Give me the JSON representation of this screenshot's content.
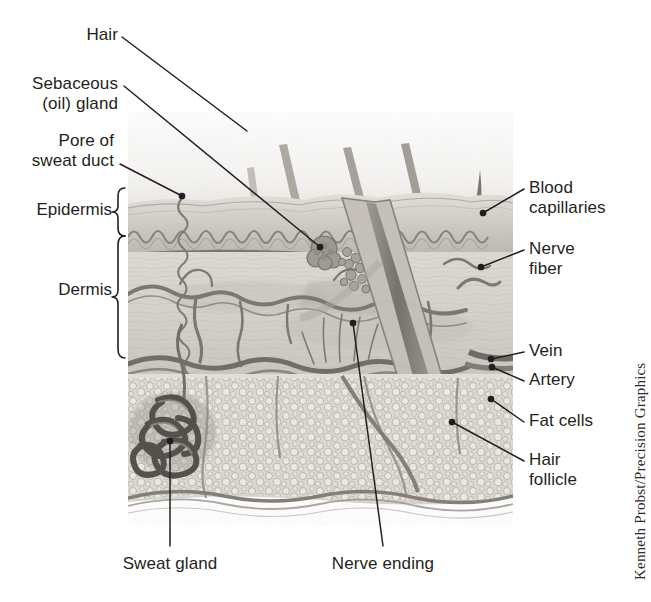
{
  "figure": {
    "credit": "Kenneth Probst/Precision Graphics",
    "style": "grayscale pencil illustration"
  },
  "colors": {
    "text": "#231f20",
    "leader_line": "#231f20",
    "credit_text": "#2b2b2b",
    "background": "#ffffff",
    "skin_light": "#e9e7e2",
    "skin_mid": "#cdc9c2",
    "skin_dark": "#8f8a84",
    "hair_dark": "#6e6a66",
    "fat_fill": "#ddd9d2"
  },
  "labels": {
    "hair": "Hair",
    "sebaceous_gland": "Sebaceous\n(oil) gland",
    "pore_of_sweat_duct": "Pore of\nsweat duct",
    "epidermis": "Epidermis",
    "dermis": "Dermis",
    "blood_capillaries": "Blood\ncapillaries",
    "nerve_fiber": "Nerve\nfiber",
    "vein": "Vein",
    "artery": "Artery",
    "fat_cells": "Fat cells",
    "hair_follicle": "Hair\nfollicle",
    "sweat_gland": "Sweat gland",
    "nerve_ending": "Nerve ending"
  },
  "annotations": [
    {
      "id": "hair",
      "label": "Hair",
      "side": "left",
      "label_x": 75,
      "label_y": 25,
      "line": [
        [
          122,
          37
        ],
        [
          247,
          131
        ]
      ],
      "dot": false
    },
    {
      "id": "sebaceous-gland",
      "label": "Sebaceous\n(oil) gland",
      "side": "left",
      "label_x": 20,
      "label_y": 74,
      "line": [
        [
          124,
          86
        ],
        [
          320,
          247
        ]
      ],
      "dot": true
    },
    {
      "id": "pore-of-sweat-duct",
      "label": "Pore of\nsweat duct",
      "side": "left",
      "label_x": 23,
      "label_y": 131,
      "line": [
        [
          120,
          164
        ],
        [
          182,
          196
        ]
      ],
      "dot": true
    },
    {
      "id": "blood-capillaries",
      "label": "Blood\ncapillaries",
      "side": "right",
      "label_x": 529,
      "label_y": 178,
      "line": [
        [
          524,
          189
        ],
        [
          483,
          213
        ]
      ],
      "dot": true
    },
    {
      "id": "nerve-fiber",
      "label": "Nerve\nfiber",
      "side": "right",
      "label_x": 529,
      "label_y": 239,
      "line": [
        [
          524,
          250
        ],
        [
          481,
          267
        ]
      ],
      "dot": true
    },
    {
      "id": "vein",
      "label": "Vein",
      "side": "right",
      "label_x": 529,
      "label_y": 341,
      "line": [
        [
          524,
          352
        ],
        [
          491,
          359
        ]
      ],
      "dot": true
    },
    {
      "id": "artery",
      "label": "Artery",
      "side": "right",
      "label_x": 529,
      "label_y": 370,
      "line": [
        [
          524,
          381
        ],
        [
          492,
          367
        ]
      ],
      "dot": true
    },
    {
      "id": "fat-cells",
      "label": "Fat cells",
      "side": "right",
      "label_x": 529,
      "label_y": 411,
      "line": [
        [
          524,
          422
        ],
        [
          491,
          399
        ]
      ],
      "dot": true
    },
    {
      "id": "hair-follicle",
      "label": "Hair\nfollicle",
      "side": "right",
      "label_x": 529,
      "label_y": 450,
      "line": [
        [
          524,
          461
        ],
        [
          452,
          422
        ]
      ],
      "dot": true
    },
    {
      "id": "sweat-gland",
      "label": "Sweat gland",
      "side": "bottom",
      "label_x": 117,
      "label_y": 554,
      "line": [
        [
          170,
          546
        ],
        [
          170,
          441
        ]
      ],
      "dot": true
    },
    {
      "id": "nerve-ending",
      "label": "Nerve ending",
      "side": "bottom",
      "label_x": 347,
      "label_y": 554,
      "line": [
        [
          383,
          546
        ],
        [
          353,
          323
        ]
      ],
      "dot": true
    }
  ],
  "braces": [
    {
      "id": "epidermis",
      "label": "Epidermis",
      "label_x": 30,
      "label_y": 201,
      "top": 188,
      "bottom": 232,
      "x": 115
    },
    {
      "id": "dermis",
      "label": "Dermis",
      "label_x": 55,
      "label_y": 281,
      "top": 235,
      "bottom": 360,
      "x": 115
    }
  ],
  "structures": [
    {
      "name": "hair-shaft",
      "count": 5,
      "description": "diagonal hair shafts emerging from skin surface"
    },
    {
      "name": "epidermis-layer",
      "description": "wavy stratified surface layer"
    },
    {
      "name": "dermis-layer",
      "description": "fibrous connective tissue with vessels"
    },
    {
      "name": "subcutaneous-fat",
      "description": "bubbly adipose cell layer"
    },
    {
      "name": "sweat-gland-coil",
      "description": "dark coiled tubular gland"
    },
    {
      "name": "sebaceous-gland",
      "description": "lobed oil gland beside follicle"
    },
    {
      "name": "hair-follicle-bulb",
      "description": "bulb at base of follicle"
    },
    {
      "name": "blood-vessel-network",
      "description": "branching capillary plexus"
    },
    {
      "name": "nerve-ending-fibers",
      "description": "fine upright nerve filaments"
    }
  ]
}
